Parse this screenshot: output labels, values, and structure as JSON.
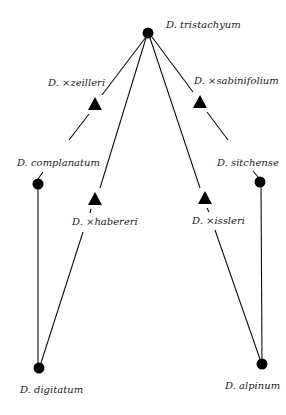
{
  "diagram": {
    "type": "hybridization-network",
    "nodes": [
      {
        "id": "tristachyum",
        "label": "D. tristachyum",
        "kind": "species"
      },
      {
        "id": "zeilleri",
        "label": "D. ×zeilleri",
        "kind": "hybrid"
      },
      {
        "id": "sabinifolium",
        "label": "D. ×sabinifolium",
        "kind": "hybrid"
      },
      {
        "id": "complanatum",
        "label": "D. complanatum",
        "kind": "species"
      },
      {
        "id": "habereri",
        "label": "D. ×habereri",
        "kind": "hybrid"
      },
      {
        "id": "issleri",
        "label": "D. ×issleri",
        "kind": "hybrid"
      },
      {
        "id": "sitchense",
        "label": "D. sitchense",
        "kind": "species"
      },
      {
        "id": "digitatum",
        "label": "D. digitatum",
        "kind": "species"
      },
      {
        "id": "alpinum",
        "label": "D. alpinum",
        "kind": "species"
      }
    ],
    "edges": [
      [
        "tristachyum",
        "zeilleri"
      ],
      [
        "zeilleri",
        "complanatum"
      ],
      [
        "tristachyum",
        "sabinifolium"
      ],
      [
        "sabinifolium",
        "sitchense"
      ],
      [
        "tristachyum",
        "habereri"
      ],
      [
        "habereri",
        "digitatum"
      ],
      [
        "tristachyum",
        "issleri"
      ],
      [
        "issleri",
        "alpinum"
      ],
      [
        "complanatum",
        "digitatum"
      ],
      [
        "sitchense",
        "alpinum"
      ]
    ],
    "legend": {
      "circle": "species",
      "triangle": "hybrid"
    }
  }
}
